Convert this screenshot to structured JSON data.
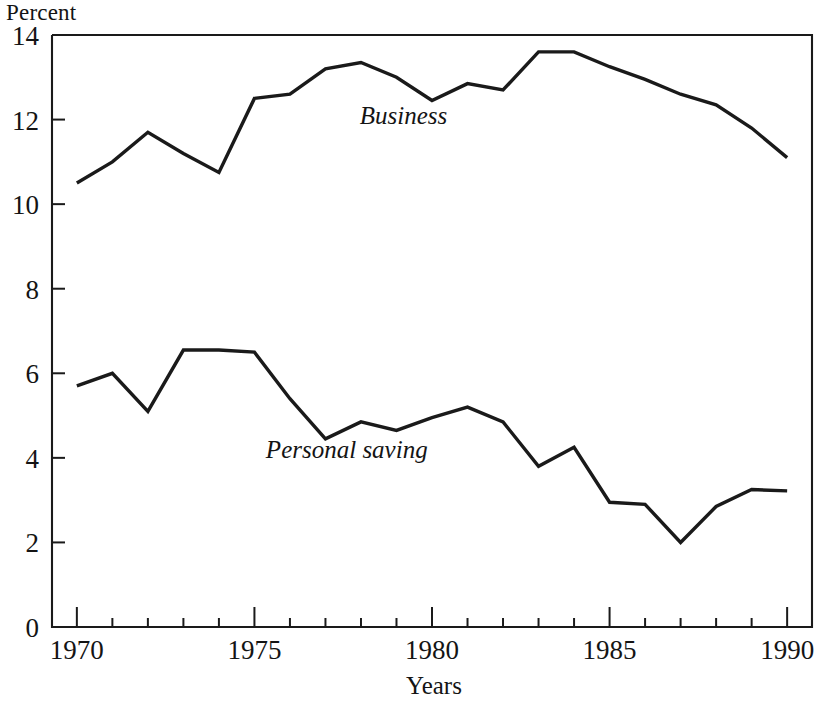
{
  "labels": {
    "y_axis_title": "Percent",
    "x_axis_title": "Years",
    "series_business": "Business",
    "series_personal": "Personal saving"
  },
  "axes": {
    "y_ticks": [
      "0",
      "2",
      "4",
      "6",
      "8",
      "10",
      "12",
      "14"
    ],
    "x_ticks": [
      "1970",
      "1975",
      "1980",
      "1985",
      "1990"
    ]
  },
  "chart_data": {
    "type": "line",
    "title": "",
    "subtitle": "",
    "xlabel": "Years",
    "ylabel": "Percent",
    "xlim": [
      1969.3,
      1990.7
    ],
    "ylim": [
      0,
      14
    ],
    "yticks": [
      0,
      2,
      4,
      6,
      8,
      10,
      12,
      14
    ],
    "xticks_major": [
      1970,
      1975,
      1980,
      1985,
      1990
    ],
    "xticks_minor": [
      1971,
      1972,
      1973,
      1974,
      1976,
      1977,
      1978,
      1979,
      1981,
      1982,
      1983,
      1984,
      1986,
      1987,
      1988,
      1989
    ],
    "grid": false,
    "legend": "inline-annotations",
    "x": [
      1970,
      1971,
      1972,
      1973,
      1974,
      1975,
      1976,
      1977,
      1978,
      1979,
      1980,
      1981,
      1982,
      1983,
      1984,
      1985,
      1986,
      1987,
      1988,
      1989,
      1990
    ],
    "series": [
      {
        "name": "Business",
        "label_position": {
          "x": 1979.2,
          "y": 11.9
        },
        "values": [
          10.5,
          11.0,
          11.7,
          11.2,
          10.75,
          12.5,
          12.6,
          13.2,
          13.35,
          13.0,
          12.45,
          12.85,
          12.7,
          13.6,
          13.6,
          13.25,
          12.95,
          12.6,
          12.35,
          11.8,
          11.1
        ]
      },
      {
        "name": "Personal saving",
        "label_position": {
          "x": 1977.6,
          "y": 4.0
        },
        "values": [
          5.7,
          6.0,
          5.1,
          6.55,
          6.55,
          6.5,
          5.4,
          4.45,
          4.85,
          4.65,
          4.95,
          5.2,
          4.85,
          3.8,
          4.25,
          2.95,
          2.9,
          2.0,
          2.85,
          3.25,
          3.22
        ]
      }
    ]
  },
  "colors": {
    "line": "#1a1a1a",
    "text": "#141414",
    "background": "#ffffff"
  }
}
